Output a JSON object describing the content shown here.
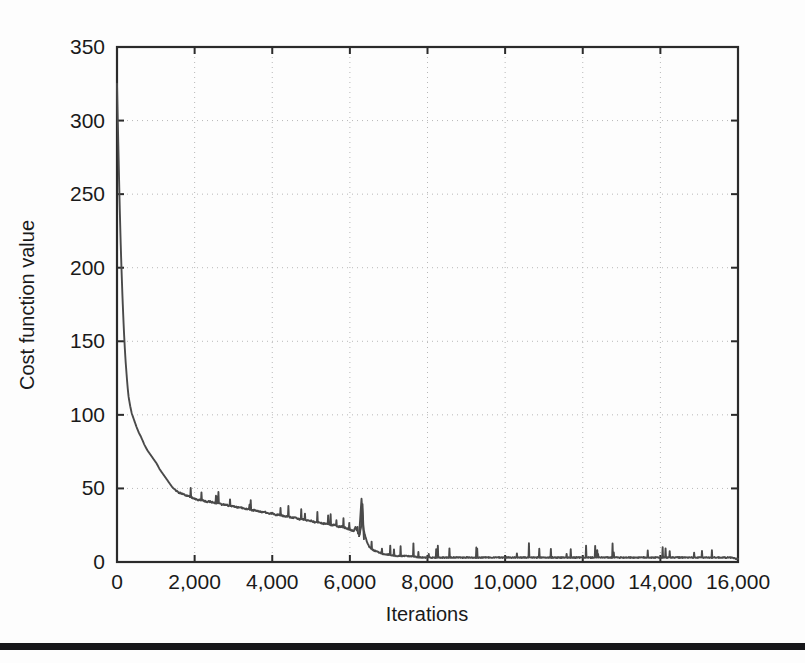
{
  "figure": {
    "background_color": "#fdfdfd",
    "line_color": "#4a4a4a",
    "axis_color": "#2b2b2b",
    "grid_color": "#b8b8b8",
    "scan_artifact_color": "#17171a"
  },
  "chart_data": {
    "type": "line",
    "title": "",
    "xlabel": "Iterations",
    "ylabel": "Cost function value",
    "xlim": [
      0,
      16000
    ],
    "ylim": [
      0,
      350
    ],
    "xticks": [
      0,
      2000,
      4000,
      6000,
      8000,
      10000,
      12000,
      14000,
      16000
    ],
    "xticklabels": [
      "0",
      "2,000",
      "4,000",
      "6,000",
      "8,000",
      "10,000",
      "12,000",
      "14,000",
      "16,000"
    ],
    "yticks": [
      0,
      50,
      100,
      150,
      200,
      250,
      300,
      350
    ],
    "yticklabels": [
      "0",
      "50",
      "100",
      "150",
      "200",
      "250",
      "300",
      "350"
    ],
    "grid": true,
    "grid_style": "dotted",
    "legend": null,
    "series": [
      {
        "name": "Cost function value",
        "color": "#4a4a4a",
        "x": [
          0,
          20,
          40,
          60,
          80,
          100,
          120,
          140,
          160,
          180,
          200,
          220,
          240,
          260,
          280,
          300,
          340,
          380,
          420,
          460,
          500,
          560,
          620,
          700,
          780,
          860,
          940,
          1020,
          1100,
          1180,
          1260,
          1340,
          1420,
          1500,
          1600,
          1700,
          1800,
          1900,
          2000,
          2100,
          2200,
          2300,
          2400,
          2500,
          2600,
          2700,
          2800,
          2900,
          3000,
          3100,
          3200,
          3300,
          3400,
          3500,
          3600,
          3700,
          3800,
          3900,
          4000,
          4100,
          4200,
          4300,
          4400,
          4500,
          4600,
          4700,
          4800,
          4900,
          5000,
          5100,
          5200,
          5300,
          5400,
          5500,
          5600,
          5700,
          5800,
          5900,
          6000,
          6100,
          6150,
          6200,
          6250,
          6300,
          6320,
          6350,
          6400,
          6450,
          6500,
          6600,
          6700,
          6800,
          6900,
          7000,
          7200,
          7400,
          7600,
          7800,
          8000,
          8200,
          8400,
          8600,
          8800,
          9000,
          9200,
          9400,
          9600,
          9800,
          10000,
          10200,
          10400,
          10600,
          10800,
          11000,
          11200,
          11400,
          11600,
          11800,
          12000,
          12200,
          12400,
          12600,
          12800,
          13000,
          13200,
          13400,
          13600,
          13800,
          14000,
          14200,
          14400,
          14600,
          14800,
          15000,
          15200,
          15400,
          15600,
          15800,
          16000
        ],
        "y": [
          325,
          300,
          276,
          252,
          231,
          212,
          196,
          181,
          168,
          156,
          146,
          137,
          130,
          123,
          117,
          112,
          106,
          101,
          98,
          95,
          92,
          88,
          85,
          80,
          76,
          73,
          70,
          67,
          63,
          60,
          57,
          54,
          51,
          49,
          47,
          46,
          45,
          44,
          43,
          42,
          42,
          41,
          41,
          40,
          40,
          39,
          39,
          38,
          38,
          37,
          37,
          36,
          36,
          35,
          35,
          34,
          34,
          33,
          33,
          32,
          32,
          31,
          31,
          30,
          30,
          29,
          29,
          28,
          28,
          27,
          27,
          26,
          26,
          25,
          25,
          24,
          24,
          23,
          22,
          21,
          24,
          20,
          18,
          26,
          43,
          22,
          17,
          13,
          10,
          8,
          7,
          6,
          5,
          5,
          4,
          4,
          4,
          3,
          3,
          3,
          3,
          3,
          3,
          3,
          3,
          3,
          3,
          3,
          3,
          3,
          3,
          3,
          3,
          3,
          3,
          3,
          3,
          3,
          3,
          3,
          3,
          3,
          3,
          3,
          3,
          3,
          3,
          3,
          3,
          3,
          3,
          3,
          3,
          3,
          3,
          3,
          3,
          3,
          2
        ]
      }
    ],
    "annotations": [
      {
        "label": "large spike",
        "x": 6300,
        "y": 43
      }
    ]
  }
}
